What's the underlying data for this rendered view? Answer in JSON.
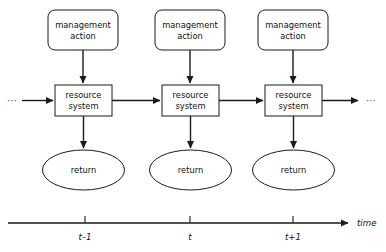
{
  "diagram": {
    "title": "",
    "stroke_color": "#1a1a1a",
    "background_color": "#ffffff",
    "text_color": "#111111",
    "columns": [
      {
        "id": "t-minus-1",
        "center_x": 85,
        "action_label_line1": "management",
        "action_label_line2": "action",
        "system_label_line1": "resource",
        "system_label_line2": "system",
        "return_label": "return",
        "time_tick_label": "t–1"
      },
      {
        "id": "t",
        "center_x": 190,
        "action_label_line1": "management",
        "action_label_line2": "action",
        "system_label_line1": "resource",
        "system_label_line2": "system",
        "return_label": "return",
        "time_tick_label": "t"
      },
      {
        "id": "t-plus-1",
        "center_x": 293,
        "action_label_line1": "management",
        "action_label_line2": "action",
        "system_label_line1": "resource",
        "system_label_line2": "system",
        "return_label": "return",
        "time_tick_label": "t+1"
      }
    ],
    "chain": {
      "left_ellipsis": "···",
      "right_ellipsis": "···"
    },
    "axis": {
      "name": "time",
      "ticks": [
        "t–1",
        "t",
        "t+1"
      ]
    }
  }
}
